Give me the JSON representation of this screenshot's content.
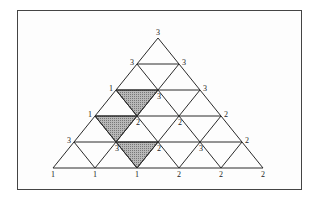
{
  "diagram": {
    "type": "triangular-grid",
    "rows": 5,
    "vertices": [
      {
        "row": 0,
        "col": 0,
        "label": "3",
        "x": 158,
        "y": 38
      },
      {
        "row": 1,
        "col": 0,
        "label": "3",
        "x": 137,
        "y": 64
      },
      {
        "row": 1,
        "col": 1,
        "label": "3",
        "x": 179,
        "y": 64
      },
      {
        "row": 2,
        "col": 0,
        "label": "1",
        "x": 116,
        "y": 90
      },
      {
        "row": 2,
        "col": 1,
        "label": "3",
        "x": 158,
        "y": 90
      },
      {
        "row": 2,
        "col": 2,
        "label": "3",
        "x": 200,
        "y": 90
      },
      {
        "row": 3,
        "col": 0,
        "label": "1",
        "x": 95,
        "y": 116
      },
      {
        "row": 3,
        "col": 1,
        "label": "2",
        "x": 137,
        "y": 116
      },
      {
        "row": 3,
        "col": 2,
        "label": "2",
        "x": 179,
        "y": 116
      },
      {
        "row": 3,
        "col": 3,
        "label": "2",
        "x": 221,
        "y": 116
      },
      {
        "row": 4,
        "col": 0,
        "label": "3",
        "x": 74,
        "y": 142
      },
      {
        "row": 4,
        "col": 1,
        "label": "3",
        "x": 116,
        "y": 142
      },
      {
        "row": 4,
        "col": 2,
        "label": "2",
        "x": 158,
        "y": 142
      },
      {
        "row": 4,
        "col": 3,
        "label": "3",
        "x": 200,
        "y": 142
      },
      {
        "row": 4,
        "col": 4,
        "label": "2",
        "x": 242,
        "y": 142
      },
      {
        "row": 5,
        "col": 0,
        "label": "1",
        "x": 53,
        "y": 168
      },
      {
        "row": 5,
        "col": 1,
        "label": "1",
        "x": 95,
        "y": 168
      },
      {
        "row": 5,
        "col": 2,
        "label": "1",
        "x": 137,
        "y": 168
      },
      {
        "row": 5,
        "col": 3,
        "label": "2",
        "x": 179,
        "y": 168
      },
      {
        "row": 5,
        "col": 4,
        "label": "2",
        "x": 221,
        "y": 168
      },
      {
        "row": 5,
        "col": 5,
        "label": "2",
        "x": 263,
        "y": 168
      }
    ],
    "shaded_triangles": [
      {
        "points": [
          [
            116,
            90
          ],
          [
            158,
            90
          ],
          [
            137,
            116
          ]
        ]
      },
      {
        "points": [
          [
            95,
            116
          ],
          [
            137,
            116
          ],
          [
            116,
            142
          ]
        ]
      },
      {
        "points": [
          [
            116,
            142
          ],
          [
            158,
            142
          ],
          [
            137,
            168
          ]
        ]
      }
    ],
    "colors": {
      "line": "#2a2a2a",
      "shade": "#a0a0a0",
      "border": "#444444"
    }
  }
}
